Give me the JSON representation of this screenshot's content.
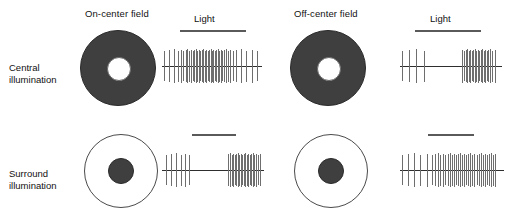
{
  "figure": {
    "columns": [
      {
        "id": "on-center",
        "label": "On-center field"
      },
      {
        "id": "off-center",
        "label": "Off-center field"
      }
    ],
    "rows": [
      {
        "id": "central",
        "label_line1": "Central",
        "label_line2": "illumination"
      },
      {
        "id": "surround",
        "label_line1": "Surround",
        "label_line2": "illumination"
      }
    ],
    "light_label": "Light",
    "colors": {
      "dark_field": "#3f3f3f",
      "light_field": "#ffffff",
      "outline": "#2a2a2a",
      "spike": "#6e6e6e",
      "baseline": "#2e2e2e",
      "light_bar": "#5a5a5a",
      "text": "#111111"
    }
  },
  "chart_data": {
    "type": "raster",
    "xlabel": "Time",
    "ylabel": "Spike activity",
    "panels": [
      {
        "id": "on-center-central",
        "column": "On-center field",
        "row": "Central illumination",
        "stimulus": {
          "label": "Light",
          "label_visible": true,
          "onset_pct": 14,
          "offset_pct": 72
        },
        "response": "sustained excitation during illumination",
        "spikes_pct": [
          2,
          7,
          12,
          16,
          19,
          21.5,
          24,
          26,
          28,
          30,
          31.5,
          33,
          34.5,
          36,
          37.5,
          39,
          40.5,
          42,
          43.5,
          45,
          46.5,
          48,
          49.5,
          51,
          52.5,
          54,
          55.5,
          57,
          58.5,
          60,
          61.5,
          63,
          65,
          67,
          69,
          72,
          76,
          81,
          86,
          92,
          97
        ]
      },
      {
        "id": "off-center-central",
        "column": "Off-center field",
        "row": "Central illumination",
        "stimulus": {
          "label": "Light",
          "label_visible": true,
          "onset_pct": 16,
          "offset_pct": 62
        },
        "response": "inhibition during illumination, burst at light offset",
        "spikes_pct": [
          2,
          9,
          16,
          24,
          62,
          64,
          65.5,
          67,
          68.5,
          70,
          71.5,
          73,
          74.5,
          76,
          77.5,
          79,
          80.5,
          82,
          83.5,
          85,
          86.5,
          88,
          90,
          92,
          95
        ]
      },
      {
        "id": "on-center-surround",
        "column": "On-center field",
        "row": "Surround illumination",
        "stimulus": {
          "label": "Light",
          "label_visible": false,
          "onset_pct": 22,
          "offset_pct": 66
        },
        "response": "inhibition during illumination, rebound burst at offset",
        "spikes_pct": [
          4,
          9,
          14,
          18.5,
          23,
          27,
          66,
          68,
          69.5,
          71,
          72.5,
          74,
          75.5,
          77,
          78.5,
          80,
          81.5,
          83,
          84.5,
          86,
          87.5,
          89,
          90.5,
          92,
          94,
          96,
          98
        ]
      },
      {
        "id": "off-center-surround",
        "column": "Off-center field",
        "row": "Surround illumination",
        "stimulus": {
          "label": "Light",
          "label_visible": false,
          "onset_pct": 22,
          "offset_pct": 66
        },
        "response": "sustained excitation during illumination",
        "spikes_pct": [
          2,
          8,
          14,
          20,
          26,
          31,
          34,
          37,
          39.5,
          42,
          44.5,
          47,
          49,
          51,
          53,
          55,
          57,
          59,
          61,
          63,
          65,
          67,
          69,
          71,
          73,
          75,
          77,
          79,
          81,
          83,
          85,
          87,
          89,
          91,
          93
        ]
      }
    ]
  }
}
